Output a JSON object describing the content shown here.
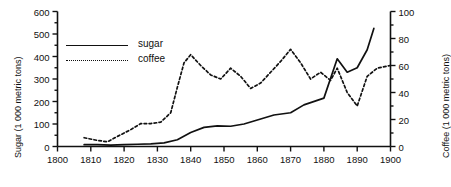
{
  "chart_data": {
    "type": "line",
    "title": "",
    "xlabel": "",
    "ylabel": "Sugar (1 000 metric tons)",
    "y2label": "Coffee (1 000 metric tons)",
    "xlim": [
      1800,
      1900
    ],
    "ylim": [
      0,
      600
    ],
    "y2lim": [
      0,
      100
    ],
    "xticks": [
      1800,
      1810,
      1820,
      1830,
      1840,
      1850,
      1860,
      1870,
      1880,
      1890,
      1900
    ],
    "xticklabels": [
      "1800",
      "1810",
      "1820",
      "1830",
      "1840",
      "1850",
      "1860",
      "1870",
      "1880",
      "1890",
      "1900"
    ],
    "yticks": [
      0,
      100,
      200,
      300,
      400,
      500,
      600
    ],
    "yticklabels": [
      "0",
      "100",
      "200",
      "300",
      "400",
      "500",
      "600"
    ],
    "y2ticks": [
      0,
      20,
      40,
      60,
      80,
      100
    ],
    "y2ticklabels": [
      "0",
      "20",
      "40",
      "60",
      "80",
      "100"
    ],
    "y_minor_step": 50,
    "y2_minor_step": 10,
    "grid": false,
    "legend_position": "upper-left",
    "series": [
      {
        "name": "sugar",
        "axis": "left",
        "style": "solid",
        "color": "#111111",
        "units": "1 000 metric tons",
        "x": [
          1808,
          1812,
          1816,
          1820,
          1824,
          1828,
          1832,
          1836,
          1840,
          1844,
          1848,
          1852,
          1856,
          1860,
          1865,
          1870,
          1874,
          1878,
          1880,
          1884,
          1887,
          1890,
          1893,
          1895
        ],
        "y": [
          8,
          8,
          6,
          8,
          10,
          12,
          16,
          30,
          62,
          85,
          92,
          90,
          100,
          118,
          140,
          150,
          185,
          205,
          215,
          390,
          330,
          350,
          430,
          525
        ]
      },
      {
        "name": "coffee",
        "axis": "right",
        "style": "dotted",
        "color": "#111111",
        "units": "1 000 metric tons",
        "x": [
          1808,
          1812,
          1815,
          1818,
          1822,
          1825,
          1828,
          1831,
          1834,
          1836,
          1838,
          1840,
          1843,
          1846,
          1849,
          1852,
          1855,
          1858,
          1861,
          1864,
          1867,
          1870,
          1873,
          1876,
          1879,
          1882,
          1884,
          1887,
          1890,
          1893,
          1896,
          1900
        ],
        "y_right": [
          6.5,
          4.5,
          3.5,
          7.5,
          12.5,
          17,
          17,
          18,
          25,
          44,
          62,
          68,
          60,
          53,
          50,
          58,
          52,
          43,
          47,
          55,
          63,
          72,
          62,
          50,
          55,
          49,
          58,
          40,
          30,
          52,
          58,
          60
        ],
        "y_left_equiv": [
          39,
          27,
          21,
          45,
          75,
          102,
          102,
          108,
          150,
          264,
          372,
          408,
          360,
          318,
          300,
          348,
          312,
          258,
          282,
          330,
          378,
          432,
          372,
          300,
          330,
          294,
          348,
          240,
          180,
          312,
          348,
          360
        ]
      }
    ],
    "legend": [
      {
        "label": "sugar",
        "style": "solid"
      },
      {
        "label": "coffee",
        "style": "dotted"
      }
    ]
  }
}
